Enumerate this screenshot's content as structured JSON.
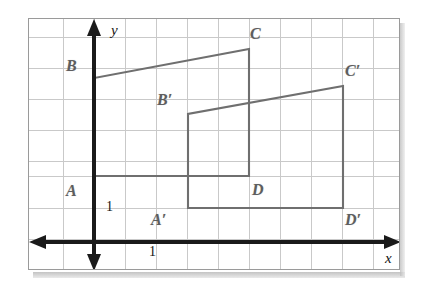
{
  "figure": {
    "background_color": "#ffffff",
    "frame_border_color": "#9a9a9a"
  },
  "grid": {
    "line_color": "#c9c9c9",
    "cell_size_px": 31,
    "columns": 12,
    "rows": 8
  },
  "axes": {
    "color": "#1a1a1a",
    "x_axis_label": "x",
    "y_axis_label": "y",
    "x_unit_label": "1",
    "y_unit_label": "1",
    "origin_px": {
      "x": 93,
      "y": 241
    }
  },
  "shapes": [
    {
      "name": "ABCD",
      "stroke_color": "#6f6f6f",
      "vertices": [
        {
          "label": "A",
          "px": {
            "x": 93,
            "y": 175
          },
          "grid": {
            "x": 0,
            "y": 2
          }
        },
        {
          "label": "B",
          "px": {
            "x": 93,
            "y": 77
          },
          "grid": {
            "x": 0,
            "y": 5
          }
        },
        {
          "label": "C",
          "px": {
            "x": 248,
            "y": 48
          },
          "grid": {
            "x": 5,
            "y": 6
          }
        },
        {
          "label": "D",
          "px": {
            "x": 248,
            "y": 175
          },
          "grid": {
            "x": 5,
            "y": 2
          }
        }
      ]
    },
    {
      "name": "A'B'C'D'",
      "stroke_color": "#6f6f6f",
      "vertices": [
        {
          "label": "A'",
          "px": {
            "x": 187,
            "y": 207
          },
          "grid": {
            "x": 3,
            "y": 1
          }
        },
        {
          "label": "B'",
          "px": {
            "x": 187,
            "y": 113
          },
          "grid": {
            "x": 3,
            "y": 4
          }
        },
        {
          "label": "C'",
          "px": {
            "x": 342,
            "y": 85
          },
          "grid": {
            "x": 8,
            "y": 5
          }
        },
        {
          "label": "D'",
          "px": {
            "x": 342,
            "y": 207
          },
          "grid": {
            "x": 8,
            "y": 1
          }
        }
      ]
    }
  ],
  "labels": {
    "A": "A",
    "B": "B",
    "C": "C",
    "D": "D",
    "A_prime": "A′",
    "B_prime": "B′",
    "C_prime": "C′",
    "D_prime": "D′",
    "x_axis": "x",
    "y_axis": "y",
    "unit_x": "1",
    "unit_y": "1"
  }
}
